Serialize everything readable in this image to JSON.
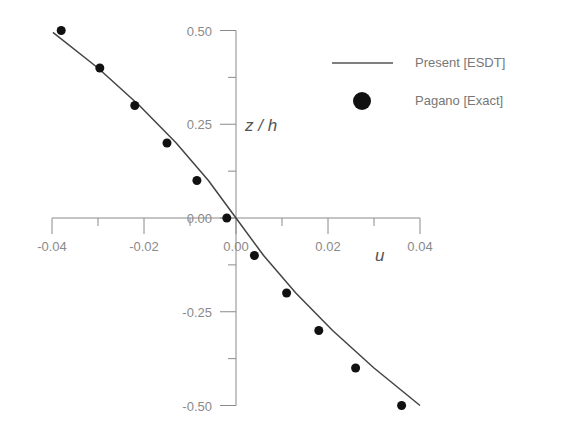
{
  "chart_data": {
    "type": "line",
    "title": "",
    "xlabel": "u",
    "ylabel": "z / h",
    "xlim": [
      -0.04,
      0.04
    ],
    "ylim": [
      -0.5,
      0.5
    ],
    "grid": false,
    "legend_position": "upper right",
    "x_ticks": [
      "-0.04",
      "-0.02",
      "0.00",
      "0.02",
      "0.04"
    ],
    "y_ticks": [
      "0.50",
      "0.25",
      "0.00",
      "-0.25",
      "-0.50"
    ],
    "series": [
      {
        "name": "Present [ESDT]",
        "style": "line",
        "color": "#444444",
        "x": [
          -0.0398,
          -0.03,
          -0.021,
          -0.013,
          -0.006,
          0.0,
          0.006,
          0.013,
          0.021,
          0.03,
          0.04
        ],
        "y": [
          0.495,
          0.4,
          0.3,
          0.2,
          0.1,
          0.0,
          -0.1,
          -0.2,
          -0.3,
          -0.4,
          -0.5
        ]
      },
      {
        "name": "Pagano [Exact]",
        "style": "marker",
        "color": "#111111",
        "x": [
          -0.038,
          -0.0296,
          -0.022,
          -0.015,
          -0.0085,
          -0.002,
          0.004,
          0.011,
          0.018,
          0.026,
          0.036
        ],
        "y": [
          0.5,
          0.4,
          0.3,
          0.2,
          0.1,
          0.0,
          -0.1,
          -0.2,
          -0.3,
          -0.4,
          -0.5
        ]
      }
    ]
  },
  "legend": {
    "items": [
      {
        "label": "Present [ESDT]",
        "kind": "line"
      },
      {
        "label": "Pagano [Exact]",
        "kind": "marker"
      }
    ]
  },
  "axes": {
    "x_label": "u",
    "y_label": "z / h"
  }
}
